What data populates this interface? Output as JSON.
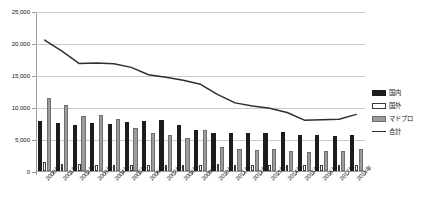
{
  "chart_data": {
    "type": "bar",
    "title": "",
    "xlabel": "",
    "ylabel": "",
    "ylim": [
      0,
      25000
    ],
    "yticks": [
      0,
      5000,
      10000,
      15000,
      20000,
      25000
    ],
    "ytick_labels": [
      "0",
      "5,000",
      "10,000",
      "15,000",
      "20,000",
      "25,000"
    ],
    "grid": true,
    "legend_position": "right",
    "categories": [
      "2000年",
      "2001年",
      "2002年",
      "2003年",
      "2004年",
      "2005年",
      "2006年",
      "2007年",
      "2008年",
      "2009年",
      "2010年",
      "2011年",
      "2012年",
      "2013年",
      "2014年",
      "2015年",
      "2016年",
      "2017年",
      "2018年"
    ],
    "series": [
      {
        "name": "国内",
        "kind": "bar",
        "color": "#1c1c1c",
        "values": [
          7800,
          7500,
          7250,
          7500,
          7350,
          7650,
          7750,
          7900,
          7250,
          6400,
          5950,
          5900,
          5950,
          5900,
          6050,
          5700,
          5600,
          5450,
          5700
        ]
      },
      {
        "name": "国外",
        "kind": "bar",
        "color": "#ffffff",
        "values": [
          1400,
          1150,
          1050,
          950,
          1000,
          1000,
          1000,
          950,
          1000,
          1000,
          1050,
          1000,
          1000,
          1000,
          1000,
          950,
          950,
          900,
          950
        ]
      },
      {
        "name": "マドプロ",
        "kind": "bar",
        "color": "#9c9c9c",
        "values": [
          11350,
          10250,
          8600,
          8700,
          8200,
          6700,
          6000,
          5550,
          5100,
          6400,
          3700,
          3450,
          3300,
          3400,
          3150,
          2900,
          3150,
          3200,
          3500
        ]
      },
      {
        "name": "合計",
        "kind": "line",
        "color": "#2e2e2e",
        "values": [
          20600,
          18900,
          16950,
          17050,
          16900,
          16350,
          15200,
          14800,
          14350,
          13700,
          12100,
          10800,
          10300,
          9950,
          9300,
          8100,
          8150,
          8250,
          9000
        ]
      }
    ]
  }
}
